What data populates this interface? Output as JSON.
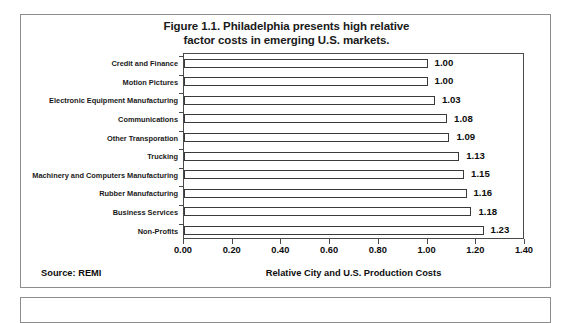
{
  "figure": {
    "title_line1": "Figure 1.1. Philadelphia presents high relative",
    "title_line2": "factor costs in emerging U.S. markets.",
    "source": "Source: REMI"
  },
  "chart_data": {
    "type": "bar",
    "orientation": "horizontal",
    "title": "Figure 1.1. Philadelphia presents high relative factor costs in emerging U.S. markets.",
    "xlabel": "Relative City and U.S. Production Costs",
    "ylabel": "",
    "xlim": [
      0.0,
      1.4
    ],
    "xticks": [
      "0.00",
      "0.20",
      "0.40",
      "0.60",
      "0.80",
      "1.00",
      "1.20",
      "1.40"
    ],
    "xtick_values": [
      0.0,
      0.2,
      0.4,
      0.6,
      0.8,
      1.0,
      1.2,
      1.4
    ],
    "grid": false,
    "legend": null,
    "bar_color": "#ffffff",
    "bar_edge_color": "#3a3a3a",
    "categories": [
      "Credit and Finance",
      "Motion Pictures",
      "Electronic Equipment Manufacturing",
      "Communications",
      "Other Transporation",
      "Trucking",
      "Machinery and Computers Manufacturing",
      "Rubber Manufacturing",
      "Business Services",
      "Non-Profits"
    ],
    "values": [
      1.0,
      1.0,
      1.03,
      1.08,
      1.09,
      1.13,
      1.15,
      1.16,
      1.18,
      1.23
    ],
    "value_labels": [
      "1.00",
      "1.00",
      "1.03",
      "1.08",
      "1.09",
      "1.13",
      "1.15",
      "1.16",
      "1.18",
      "1.23"
    ]
  }
}
